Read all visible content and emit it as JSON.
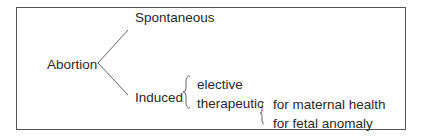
{
  "diagram": {
    "root": "Abortion",
    "branches": [
      {
        "label": "Spontaneous"
      },
      {
        "label": "Induced",
        "children": [
          {
            "label": "elective"
          },
          {
            "label": "therapeutic",
            "children": [
              {
                "label": "for maternal health"
              },
              {
                "label": "for fetal anomaly"
              }
            ]
          }
        ]
      }
    ]
  },
  "colors": {
    "line": "#666666",
    "text": "#2a2a2a",
    "border": "#555555"
  }
}
